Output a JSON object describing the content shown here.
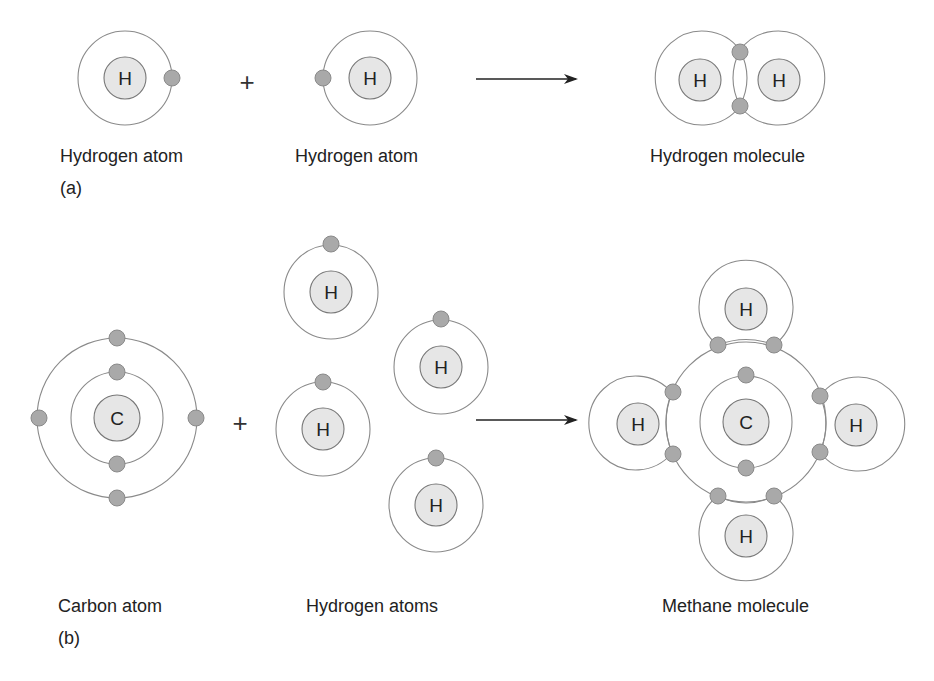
{
  "diagram": {
    "part_a": {
      "panel_label": "(a)",
      "reactant_1": {
        "label": "Hydrogen atom",
        "nucleus_symbol": "H"
      },
      "operator": "+",
      "reactant_2": {
        "label": "Hydrogen atom",
        "nucleus_symbol": "H"
      },
      "product": {
        "label": "Hydrogen molecule",
        "nucleus_symbols": [
          "H",
          "H"
        ]
      }
    },
    "part_b": {
      "panel_label": "(b)",
      "reactant_1": {
        "label": "Carbon atom",
        "nucleus_symbol": "C"
      },
      "operator": "+",
      "reactant_2": {
        "label": "Hydrogen atoms",
        "nucleus_symbols": [
          "H",
          "H",
          "H",
          "H"
        ]
      },
      "product": {
        "label": "Methane molecule",
        "center_symbol": "C",
        "outer_symbols": [
          "H",
          "H",
          "H",
          "H"
        ]
      }
    },
    "colors": {
      "nucleus_fill": "#e6e6e6",
      "electron_fill": "#a9a9a9",
      "orbit_stroke": "#8a8a8a",
      "text": "#222222"
    }
  }
}
